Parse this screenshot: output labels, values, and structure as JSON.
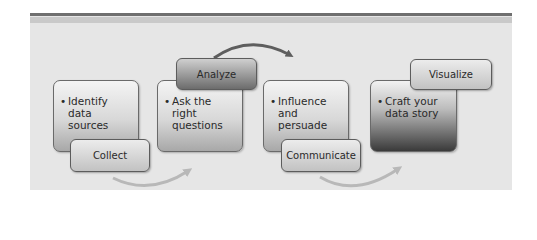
{
  "diagram": {
    "stages": [
      {
        "label": "Collect",
        "bullet": "Identify data sources",
        "lines": [
          "Identify",
          "data",
          "sources"
        ]
      },
      {
        "label": "Analyze",
        "bullet": "Ask the right questions",
        "lines": [
          "Ask the",
          "right",
          "questions"
        ]
      },
      {
        "label": "Communicate",
        "bullet": "Influence and persuade",
        "lines": [
          "Influence",
          "and",
          "persuade"
        ]
      },
      {
        "label": "Visualize",
        "bullet": "Craft your data story",
        "lines": [
          "Craft your",
          "data story"
        ]
      }
    ],
    "bullet_glyph": "•",
    "colors": {
      "panel": "#e6e6e6",
      "rule_dark": "#6f6f6f",
      "arrow_dark": "#5e5e5e",
      "arrow_light": "#b8b8b8"
    }
  }
}
